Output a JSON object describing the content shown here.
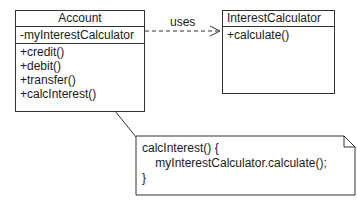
{
  "account_class": {
    "name": "Account",
    "attributes": [
      "-myInterestCalculator"
    ],
    "operations": [
      "+credit()",
      "+debit()",
      "+transfer()",
      "+calcInterest()"
    ]
  },
  "interest_calculator_class": {
    "name": "InterestCalculator",
    "operations": [
      "+calculate()"
    ]
  },
  "dependency": {
    "label": "uses"
  },
  "note": {
    "lines": [
      "calcInterest() {",
      "    myInterestCalculator.calculate();",
      "}"
    ]
  }
}
